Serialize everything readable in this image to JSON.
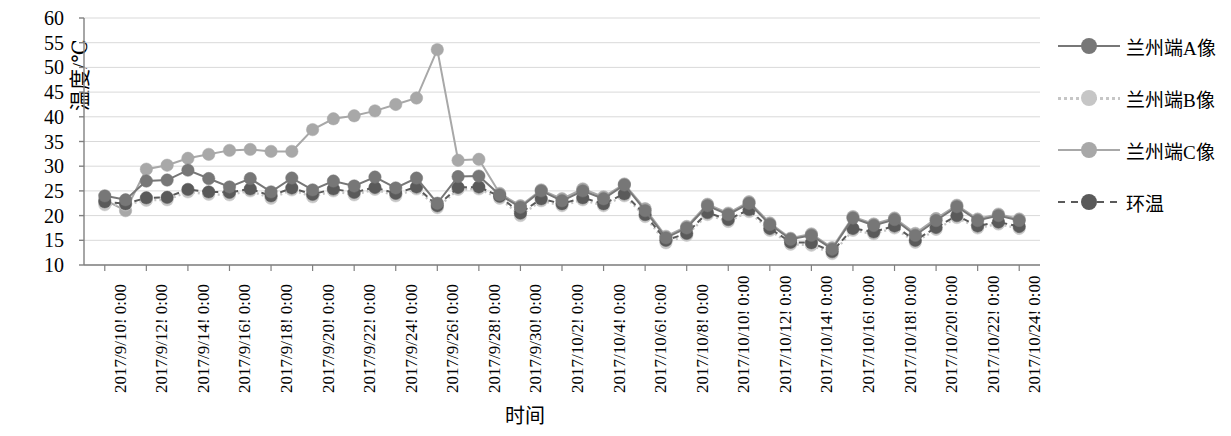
{
  "chart_data": {
    "type": "line",
    "title": "",
    "xlabel": "时间",
    "ylabel": "温度/℃",
    "ylim": [
      10,
      60
    ],
    "ytick_step": 5,
    "yticks": [
      60,
      55,
      50,
      45,
      40,
      35,
      30,
      25,
      20,
      15,
      10
    ],
    "grid": true,
    "legend_position": "right",
    "xtick_labels": [
      "2017/9/10! 0:00",
      "2017/9/12! 0:00",
      "2017/9/14! 0:00",
      "2017/9/16! 0:00",
      "2017/9/18! 0:00",
      "2017/9/20! 0:00",
      "2017/9/22! 0:00",
      "2017/9/24! 0:00",
      "2017/9/26! 0:00",
      "2017/9/28! 0:00",
      "2017/9/30! 0:00",
      "2017/10/2! 0:00",
      "2017/10/4! 0:00",
      "2017/10/6! 0:00",
      "2017/10/8! 0:00",
      "2017/10/10! 0:00",
      "2017/10/12! 0:00",
      "2017/10/14! 0:00",
      "2017/10/16! 0:00",
      "2017/10/18! 0:00",
      "2017/10/20! 0:00",
      "2017/10/22! 0:00",
      "2017/10/24! 0:00"
    ],
    "x_index_of_first_tick": 0,
    "x_points_per_tick": 2,
    "n_points": 45,
    "series": [
      {
        "name": "兰州端A像",
        "color": "#777777",
        "line_style": "solid",
        "marker": "circle",
        "values": [
          24.0,
          23.2,
          27.0,
          27.2,
          29.2,
          27.5,
          25.8,
          27.5,
          24.8,
          27.6,
          25.2,
          27.0,
          26.0,
          27.8,
          25.6,
          27.6,
          22.5,
          27.9,
          28.0,
          24.2,
          21.7,
          25.0,
          23.0,
          25.0,
          23.4,
          26.2,
          21.0,
          15.5,
          17.5,
          22.0,
          20.2,
          22.5,
          18.2,
          15.2,
          16.0,
          13.2,
          19.5,
          18.0,
          19.2,
          16.0,
          19.0,
          21.8,
          19.0,
          20.0,
          19.0
        ]
      },
      {
        "name": "兰州端B像",
        "color": "#c6c6c6",
        "line_style": "dotted",
        "marker": "circle",
        "values": [
          22.2,
          22.2,
          23.1,
          23.2,
          24.8,
          24.3,
          24.2,
          25.0,
          23.5,
          25.2,
          23.8,
          25.0,
          24.2,
          25.3,
          24.0,
          25.4,
          21.6,
          25.3,
          25.4,
          23.5,
          20.0,
          23.0,
          22.0,
          23.2,
          22.0,
          24.0,
          19.8,
          14.5,
          16.0,
          20.2,
          18.8,
          20.8,
          17.0,
          14.2,
          14.0,
          12.3,
          17.0,
          16.3,
          17.5,
          14.6,
          17.2,
          19.6,
          17.5,
          18.3,
          17.4
        ]
      },
      {
        "name": "兰州端C像",
        "color": "#a8a8a8",
        "line_style": "solid",
        "marker": "circle",
        "values": [
          23.2,
          21.0,
          29.4,
          30.2,
          31.6,
          32.4,
          33.2,
          33.4,
          33.0,
          33.0,
          37.4,
          39.6,
          40.2,
          41.2,
          42.5,
          43.8,
          53.6,
          31.2,
          31.4,
          24.5,
          22.0,
          25.2,
          23.4,
          25.4,
          23.8,
          26.4,
          21.4,
          15.8,
          17.8,
          22.3,
          20.5,
          22.8,
          18.5,
          15.4,
          16.3,
          13.5,
          19.8,
          18.3,
          19.5,
          16.4,
          19.4,
          22.1,
          19.3,
          20.3,
          19.3
        ]
      },
      {
        "name": "环温",
        "color": "#5a5a5a",
        "line_style": "dashed",
        "marker": "circle",
        "values": [
          22.8,
          22.4,
          23.6,
          23.7,
          25.3,
          24.8,
          24.7,
          25.4,
          24.0,
          25.6,
          24.3,
          25.4,
          24.7,
          25.7,
          24.5,
          25.8,
          22.0,
          25.7,
          25.8,
          23.9,
          20.5,
          23.4,
          22.4,
          23.6,
          22.4,
          24.4,
          20.2,
          15.0,
          16.4,
          20.6,
          19.2,
          21.2,
          17.4,
          14.6,
          14.5,
          12.7,
          17.4,
          16.7,
          17.9,
          15.0,
          17.6,
          20.0,
          17.9,
          18.7,
          17.8
        ]
      }
    ]
  },
  "legend": {
    "items": [
      {
        "label": "兰州端A像",
        "color": "#777777",
        "style": "solid"
      },
      {
        "label": "兰州端B像",
        "color": "#c6c6c6",
        "style": "dotted"
      },
      {
        "label": "兰州端C像",
        "color": "#a8a8a8",
        "style": "solid"
      },
      {
        "label": "环温",
        "color": "#5a5a5a",
        "style": "dashed"
      }
    ]
  }
}
